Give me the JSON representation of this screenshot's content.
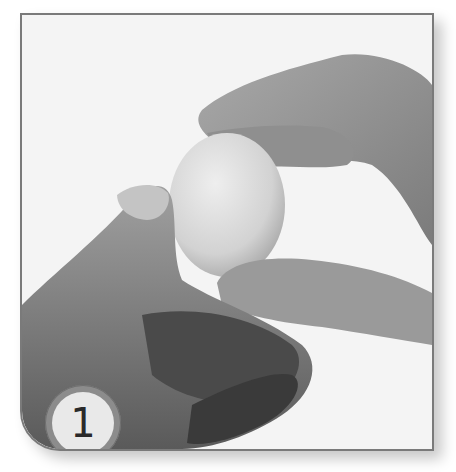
{
  "figure": {
    "kind": "instructional-photo",
    "palette": {
      "background": "#f4f4f4",
      "frame_border": "#7a7a7a",
      "skin_light": "#b5b5b5",
      "skin_mid": "#8a8a8a",
      "skin_dark": "#3c3c3c",
      "egg": "#d9d9d9"
    }
  },
  "step_badge": {
    "number": "1"
  }
}
